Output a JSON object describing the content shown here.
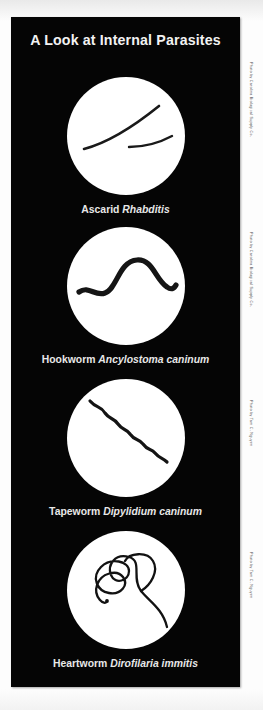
{
  "poster": {
    "title": "A Look at Internal Parasites",
    "background_color": "#050505",
    "text_color": "#f2f2f2",
    "page_background": "#fdfdfd"
  },
  "figures": [
    {
      "common_name": "Ascarid",
      "scientific_name": "Rhabditis",
      "image_name": "ascarid-roundworm-photo",
      "credit": "Photo by Carolina Biological Supply Co."
    },
    {
      "common_name": "Hookworm",
      "scientific_name": "Ancylostoma caninum",
      "image_name": "hookworm-photo",
      "credit": "Photo by Carolina Biological Supply Co."
    },
    {
      "common_name": "Tapeworm",
      "scientific_name": "Dipylidium caninum",
      "image_name": "tapeworm-photo",
      "credit": "Photo by Tam C. Nguyen"
    },
    {
      "common_name": "Heartworm",
      "scientific_name": "Dirofilaria immitis",
      "image_name": "heartworm-photo",
      "credit": "Photo by Tam C. Nguyen"
    }
  ]
}
